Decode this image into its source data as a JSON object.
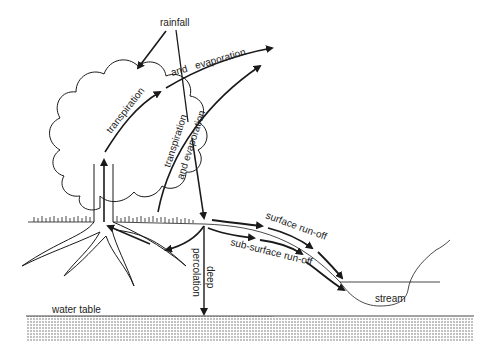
{
  "diagram": {
    "title": "",
    "labels": {
      "rainfall": "rainfall",
      "transpiration_tree": "transpiration",
      "and_evaporation_top": "and   evaporation",
      "transpiration_ground": "transpiration",
      "and_evaporation_ground": "and evaporation",
      "surface_runoff": "surface run-off",
      "subsurface_runoff": "sub-surface run-off",
      "percolation": "percolation",
      "deep": "deep",
      "water_table": "water table",
      "stream": "stream"
    },
    "colors": {
      "line": "#1a1a1a",
      "background": "#ffffff",
      "ground_dots": "#555555"
    }
  }
}
